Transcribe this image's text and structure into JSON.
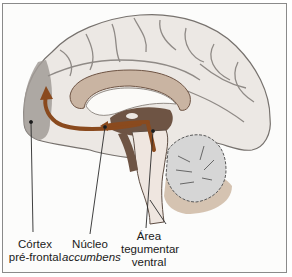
{
  "diagram": {
    "type": "sagittal brain section",
    "colors": {
      "cortex": "#ece8e4",
      "sulcus_line": "#8f8a86",
      "prefrontal_region": "#a29c98",
      "pathway_arrow": "#8a4a1e",
      "deep_structures": "#6e5444",
      "cerebellum": "#d6d6d6",
      "brainstem_shadow": "#c4ab92"
    },
    "labels": {
      "prefrontal": {
        "line1": "Córtex",
        "line2": "pré-frontal"
      },
      "accumbens": {
        "line1": "Núcleo",
        "line2": "accumbens"
      },
      "vta": {
        "line1": "Área",
        "line2": "tegumentar",
        "line3": "ventral"
      }
    }
  }
}
